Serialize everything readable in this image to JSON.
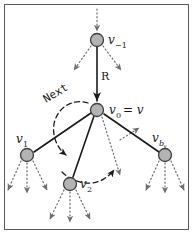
{
  "figure": {
    "type": "diagram",
    "kind": "tree-traversal-graph",
    "border_color": "#5a5a5a",
    "node_fill": "#b3b3b3",
    "node_stroke": "#3d3d3d",
    "solid_edge_color": "#1a1a1a",
    "dotted_edge_color": "#6e6e6e",
    "dashed_arc_color": "#1a1a1a",
    "background": "#ffffff"
  },
  "nodes": [
    {
      "id": "v-minus-1",
      "label": "v",
      "sub": "−1",
      "cx": 97,
      "cy": 40,
      "r": 6.5
    },
    {
      "id": "v0",
      "label": "v",
      "sub": "0",
      "cx": 97,
      "cy": 110,
      "r": 6.5,
      "extra": " = v"
    },
    {
      "id": "v1",
      "label": "v",
      "sub": "1",
      "cx": 27,
      "cy": 155,
      "r": 6.5
    },
    {
      "id": "v2",
      "label": "v",
      "sub": "2",
      "cx": 70,
      "cy": 184,
      "r": 6.5
    },
    {
      "id": "vbv",
      "label": "v",
      "sub": "b",
      "sub2": "v",
      "cx": 165,
      "cy": 155,
      "r": 6.5
    }
  ],
  "labels": {
    "v_minus_1": "v",
    "v_minus_1_sub": "−1",
    "v_zero": "v",
    "v_zero_sub": "0",
    "v_zero_eq": "= v",
    "v_one": "v",
    "v_one_sub": "1",
    "v_two": "v",
    "v_two_sub": "2",
    "v_bv": "v",
    "v_bv_sub": "b",
    "v_bv_subsub": "v",
    "edge_r": "R",
    "arc_next": "Next"
  }
}
